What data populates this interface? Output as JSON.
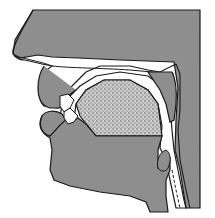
{
  "diagram": {
    "type": "vocal-tract-sagittal-section",
    "view": "left-facing head profile",
    "colors": {
      "background": "#ffffff",
      "tissue": "#8e8e8e",
      "tongue_stipple": "#b5b5b5",
      "airway": "#ffffff",
      "outline": "#1a1a1a"
    },
    "parts": [
      {
        "id": "nose",
        "label": ""
      },
      {
        "id": "upper-lip",
        "label": ""
      },
      {
        "id": "lower-lip",
        "label": ""
      },
      {
        "id": "upper-teeth",
        "label": ""
      },
      {
        "id": "lower-teeth",
        "label": ""
      },
      {
        "id": "tongue",
        "label": ""
      },
      {
        "id": "hard-palate",
        "label": ""
      },
      {
        "id": "velum",
        "label": ""
      },
      {
        "id": "pharynx",
        "label": ""
      },
      {
        "id": "epiglottis",
        "label": ""
      },
      {
        "id": "chin",
        "label": ""
      }
    ]
  }
}
